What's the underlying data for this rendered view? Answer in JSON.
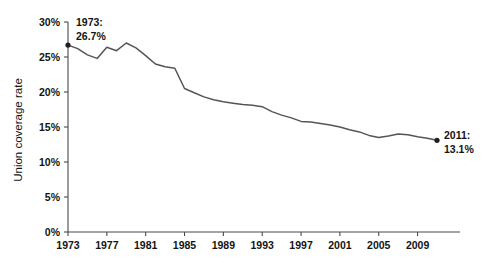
{
  "chart_data": {
    "type": "line",
    "title": "",
    "xlabel": "",
    "ylabel": "Union coverage rate",
    "xlim": [
      1973,
      2011
    ],
    "ylim": [
      0,
      30
    ],
    "grid": false,
    "legend": null,
    "y_tick_labels": [
      "0%",
      "5%",
      "10%",
      "15%",
      "20%",
      "25%",
      "30%"
    ],
    "y_tick_values": [
      0,
      5,
      10,
      15,
      20,
      25,
      30
    ],
    "x_tick_labels": [
      "1973",
      "1977",
      "1981",
      "1985",
      "1989",
      "1993",
      "1997",
      "2001",
      "2005",
      "2009"
    ],
    "x_tick_values": [
      1973,
      1977,
      1981,
      1985,
      1989,
      1993,
      1997,
      2001,
      2005,
      2009
    ],
    "series": [
      {
        "name": "Union coverage rate",
        "color": "#555555",
        "x": [
          1973,
          1974,
          1975,
          1976,
          1977,
          1978,
          1979,
          1980,
          1981,
          1982,
          1983,
          1984,
          1985,
          1986,
          1987,
          1988,
          1989,
          1990,
          1991,
          1992,
          1993,
          1994,
          1995,
          1996,
          1997,
          1998,
          1999,
          2000,
          2001,
          2002,
          2003,
          2004,
          2005,
          2006,
          2007,
          2008,
          2009,
          2010,
          2011
        ],
        "values": [
          26.7,
          26.2,
          25.3,
          24.8,
          26.4,
          25.9,
          27.0,
          26.3,
          25.2,
          24.0,
          23.6,
          23.4,
          20.5,
          19.9,
          19.3,
          18.9,
          18.6,
          18.4,
          18.2,
          18.1,
          17.9,
          17.2,
          16.7,
          16.3,
          15.8,
          15.7,
          15.5,
          15.3,
          15.0,
          14.6,
          14.3,
          13.8,
          13.5,
          13.7,
          14.0,
          13.9,
          13.6,
          13.4,
          13.1
        ]
      }
    ],
    "annotations": [
      {
        "name": "start-annotation",
        "year": 1973,
        "value": 26.7,
        "line1": "1973:",
        "line2": "26.7%",
        "marker": true
      },
      {
        "name": "end-annotation",
        "year": 2011,
        "value": 13.1,
        "line1": "2011:",
        "line2": "13.1%",
        "marker": true
      }
    ]
  }
}
